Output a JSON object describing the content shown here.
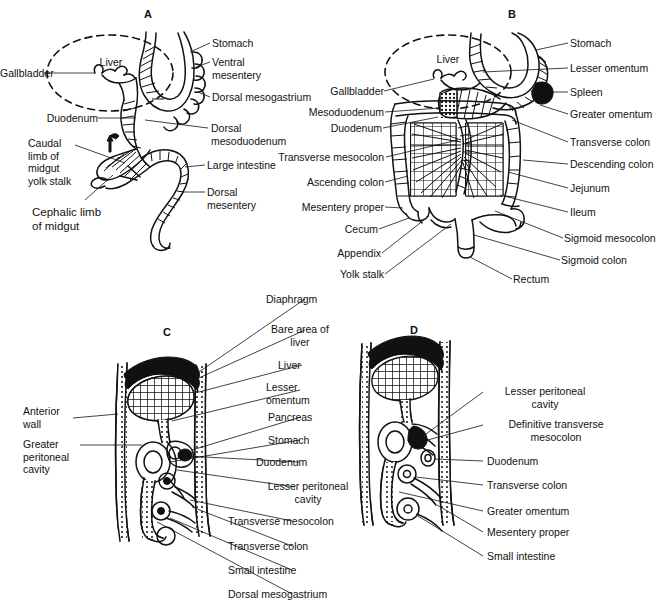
{
  "figure": {
    "panels": [
      {
        "id": "A",
        "letter": "A",
        "labels": [
          {
            "key": "stomach",
            "text": "Stomach"
          },
          {
            "key": "ventral_mesentery",
            "text": "Ventral\nmesentery"
          },
          {
            "key": "dorsal_mesogastrium",
            "text": "Dorsal mesogastrium"
          },
          {
            "key": "dorsal_mesoduodenum",
            "text": "Dorsal\nmesoduodenum"
          },
          {
            "key": "large_intestine",
            "text": "Large intestine"
          },
          {
            "key": "dorsal_mesentery",
            "text": "Dorsal\nmesentery"
          },
          {
            "key": "liver",
            "text": "Liver"
          },
          {
            "key": "gallbladder",
            "text": "Gallbladder"
          },
          {
            "key": "duodenum",
            "text": "Duodenum"
          },
          {
            "key": "caudal_limb",
            "text": "Caudal\nlimb of\nmidgut\nyolk stalk"
          },
          {
            "key": "cephalic_limb",
            "text": "Cephalic limb\nof midgut"
          }
        ]
      },
      {
        "id": "B",
        "letter": "B",
        "labels": [
          {
            "key": "stomach",
            "text": "Stomach"
          },
          {
            "key": "lesser_omentum",
            "text": "Lesser omentum"
          },
          {
            "key": "spleen",
            "text": "Spleen"
          },
          {
            "key": "greater_omentum",
            "text": "Greater omentum"
          },
          {
            "key": "transverse_colon",
            "text": "Transverse colon"
          },
          {
            "key": "descending_colon",
            "text": "Descending colon"
          },
          {
            "key": "jejunum",
            "text": "Jejunum"
          },
          {
            "key": "ileum",
            "text": "Ileum"
          },
          {
            "key": "sigmoid_mesocolon",
            "text": "Sigmoid mesocolon"
          },
          {
            "key": "sigmoid_colon",
            "text": "Sigmoid colon"
          },
          {
            "key": "rectum",
            "text": "Rectum"
          },
          {
            "key": "liver",
            "text": "Liver"
          },
          {
            "key": "gallbladder",
            "text": "Gallbladder"
          },
          {
            "key": "mesoduodenum",
            "text": "Mesoduodenum"
          },
          {
            "key": "duodenum",
            "text": "Duodenum"
          },
          {
            "key": "transverse_mesocolon",
            "text": "Transverse mesocolon"
          },
          {
            "key": "ascending_colon",
            "text": "Ascending colon"
          },
          {
            "key": "mesentery_proper",
            "text": "Mesentery proper"
          },
          {
            "key": "cecum",
            "text": "Cecum"
          },
          {
            "key": "appendix",
            "text": "Appendix"
          },
          {
            "key": "yolk_stalk",
            "text": "Yolk stalk"
          }
        ]
      },
      {
        "id": "C",
        "letter": "C",
        "labels": [
          {
            "key": "diaphragm",
            "text": "Diaphragm"
          },
          {
            "key": "bare_area",
            "text": "Bare area of\nliver"
          },
          {
            "key": "liver",
            "text": "Liver"
          },
          {
            "key": "lesser_omentum",
            "text": "Lesser\nomentum"
          },
          {
            "key": "pancreas",
            "text": "Pancreas"
          },
          {
            "key": "stomach",
            "text": "Stomach"
          },
          {
            "key": "duodenum",
            "text": "Duodenum"
          },
          {
            "key": "lesser_peritoneal_cavity",
            "text": "Lesser peritoneal\ncavity"
          },
          {
            "key": "transverse_mesocolon",
            "text": "Transverse mesocolon"
          },
          {
            "key": "transverse_colon",
            "text": "Transverse colon"
          },
          {
            "key": "small_intestine",
            "text": "Small intestine"
          },
          {
            "key": "dorsal_mesogastrium",
            "text": "Dorsal mesogastrium"
          },
          {
            "key": "anterior_wall",
            "text": "Anterior\nwall"
          },
          {
            "key": "greater_peritoneal_cavity",
            "text": "Greater\nperitoneal\ncavity"
          }
        ]
      },
      {
        "id": "D",
        "letter": "D",
        "labels": [
          {
            "key": "lesser_peritoneal_cavity",
            "text": "Lesser peritoneal\ncavity"
          },
          {
            "key": "definitive_transverse_mesocolon",
            "text": "Definitive transverse\nmesocolon"
          },
          {
            "key": "duodenum",
            "text": "Duodenum"
          },
          {
            "key": "transverse_colon",
            "text": "Transverse colon"
          },
          {
            "key": "greater_omentum",
            "text": "Greater omentum"
          },
          {
            "key": "mesentery_proper",
            "text": "Mesentery proper"
          },
          {
            "key": "small_intestine",
            "text": "Small intestine"
          }
        ]
      }
    ],
    "colors": {
      "ink": "#111111",
      "background": "#ffffff"
    }
  }
}
